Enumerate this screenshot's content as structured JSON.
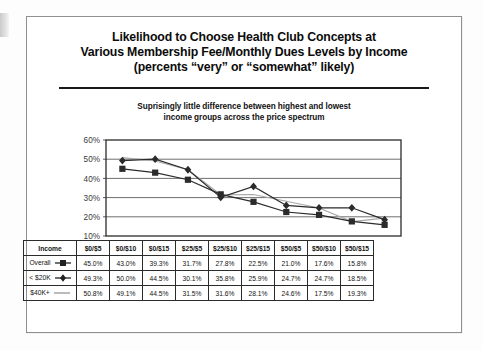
{
  "slide": {
    "title_lines": [
      "Likelihood to Choose Health Club Concepts at",
      "Various Membership Fee/Monthly Dues Levels by Income",
      "(percents “very” or “somewhat” likely)"
    ],
    "subtitle_lines": [
      "Suprisingly little difference between highest and lowest",
      "income groups across the price spectrum"
    ]
  },
  "table": {
    "header": [
      "Income",
      "$0/$5",
      "$0/$10",
      "$0/$15",
      "$25/$5",
      "$25/$10",
      "$25/$15",
      "$50/$5",
      "$50/$10",
      "$50/$15"
    ],
    "rows": [
      {
        "label": "Overall",
        "marker": "square-marker",
        "values": [
          "45.0%",
          "43.0%",
          "39.3%",
          "31.7%",
          "27.8%",
          "22.5%",
          "21.0%",
          "17.6%",
          "15.8%"
        ]
      },
      {
        "label": "< $20K",
        "marker": "diamond-marker",
        "values": [
          "49.3%",
          "50.0%",
          "44.5%",
          "30.1%",
          "35.8%",
          "25.9%",
          "24.7%",
          "24.7%",
          "18.5%"
        ]
      },
      {
        "label": "$40K+",
        "marker": "line-marker",
        "values": [
          "50.8%",
          "49.1%",
          "44.5%",
          "31.5%",
          "31.6%",
          "28.1%",
          "24.6%",
          "17.5%",
          "19.3%"
        ]
      }
    ]
  },
  "chart_data": {
    "type": "line",
    "title": "Likelihood to Choose Health Club Concepts at Various Membership Fee/Monthly Dues Levels by Income (percents “very” or “somewhat” likely)",
    "subtitle": "Suprisingly little difference between highest and lowest income groups across the price spectrum",
    "xlabel": "",
    "ylabel": "",
    "categories": [
      "$0/$5",
      "$0/$10",
      "$0/$15",
      "$25/$5",
      "$25/$10",
      "$25/$15",
      "$50/$5",
      "$50/$10",
      "$50/$15"
    ],
    "ylim": [
      10,
      60
    ],
    "ytick_labels": [
      "60%",
      "50%",
      "40%",
      "30%",
      "20%",
      "10%"
    ],
    "ytick_values": [
      60,
      50,
      40,
      30,
      20,
      10
    ],
    "grid": true,
    "legend_position": "table-row-labels",
    "series": [
      {
        "name": "Overall",
        "marker": "square",
        "color": "#2b2b2b",
        "values": [
          45.0,
          43.0,
          39.3,
          31.7,
          27.8,
          22.5,
          21.0,
          17.6,
          15.8
        ]
      },
      {
        "name": "< $20K",
        "marker": "diamond",
        "color": "#2b2b2b",
        "values": [
          49.3,
          50.0,
          44.5,
          30.1,
          35.8,
          25.9,
          24.7,
          24.7,
          18.5
        ]
      },
      {
        "name": "$40K+",
        "marker": "none",
        "color": "#a8a8a8",
        "values": [
          50.8,
          49.1,
          44.5,
          31.5,
          31.6,
          28.1,
          24.6,
          17.5,
          19.3
        ]
      }
    ]
  }
}
